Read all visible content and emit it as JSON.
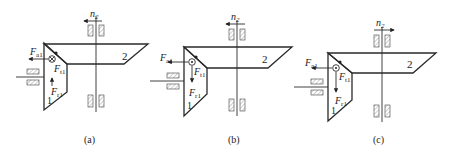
{
  "figure": {
    "panels": [
      {
        "id": "a",
        "caption": "(a)",
        "gear1_label": "1",
        "gear2_label": "2",
        "speed_label": "n",
        "speed_sub": "2",
        "speed_direction": "left",
        "axial_force": {
          "symbol": "F",
          "sub": "a1",
          "direction": "left"
        },
        "tangential_force": {
          "symbol": "F",
          "sub": "t1",
          "direction": "into-page"
        },
        "radial_force": {
          "symbol": "F",
          "sub": "r1",
          "direction": "up"
        }
      },
      {
        "id": "b",
        "caption": "(b)",
        "gear1_label": "1",
        "gear2_label": "2",
        "speed_label": "n",
        "speed_sub": "2",
        "speed_direction": "left",
        "axial_force": {
          "symbol": "F",
          "sub": "a1",
          "direction": "left"
        },
        "tangential_force": {
          "symbol": "F",
          "sub": "t1",
          "direction": "out-of-page"
        },
        "radial_force": {
          "symbol": "F",
          "sub": "r1",
          "direction": "down"
        }
      },
      {
        "id": "c",
        "caption": "(c)",
        "gear1_label": "1",
        "gear2_label": "2",
        "speed_label": "n",
        "speed_sub": "2",
        "speed_direction": "right",
        "axial_force": {
          "symbol": "F",
          "sub": "a1",
          "direction": "left"
        },
        "tangential_force": {
          "symbol": "F",
          "sub": "t1",
          "direction": "out-of-page"
        },
        "radial_force": {
          "symbol": "F",
          "sub": "r1",
          "direction": "down"
        }
      }
    ]
  }
}
